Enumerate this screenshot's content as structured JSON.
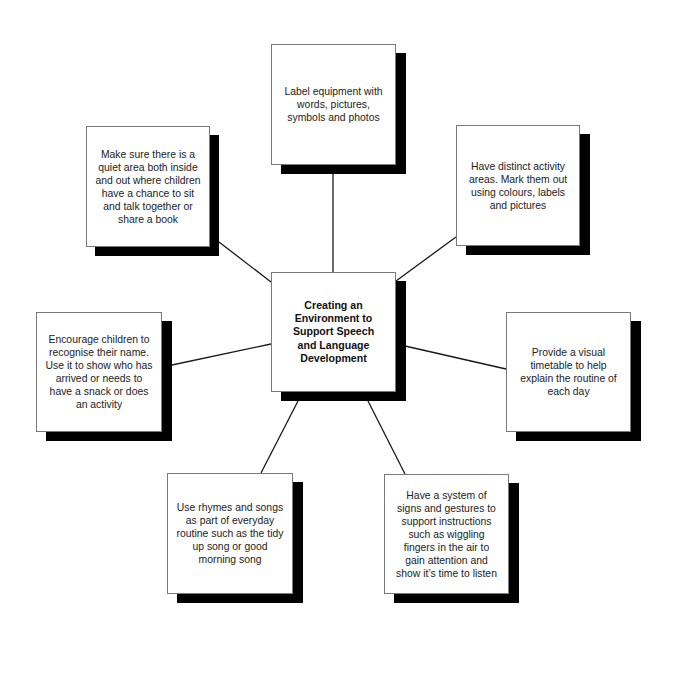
{
  "diagram": {
    "type": "mind-map",
    "center": {
      "text": "Creating an Environment to Support Speech and Language Development",
      "lines": [
        "Creating an",
        "Environment to",
        "Support Speech",
        "and Language",
        "Development"
      ]
    },
    "nodes": [
      {
        "position": "top",
        "text": "Label equipment with words, pictures, symbols and photos"
      },
      {
        "position": "top-left",
        "text": "Make sure there is a quiet area both inside and out where children have a chance to sit and talk together or share a book"
      },
      {
        "position": "top-right",
        "text": "Have distinct activity areas. Mark them out using colours, labels and pictures"
      },
      {
        "position": "left",
        "text": "Encourage children to recognise their name. Use it to show who has arrived or needs to have a snack or does an activity"
      },
      {
        "position": "right",
        "text": "Provide a visual timetable to help explain the routine of each day"
      },
      {
        "position": "bottom-left",
        "text": "Use rhymes and songs as part of everyday routine such as the tidy up song or good morning song"
      },
      {
        "position": "bottom-right",
        "text": "Have a system of signs and gestures to support instructions such as wiggling fingers in the air to gain attention and show it’s time to listen"
      }
    ],
    "colors": {
      "box_fill": "#ffffff",
      "box_border": "#7a7a7a",
      "shadow": "#000000",
      "connector": "#1a1a1a",
      "text": "#222222"
    }
  }
}
